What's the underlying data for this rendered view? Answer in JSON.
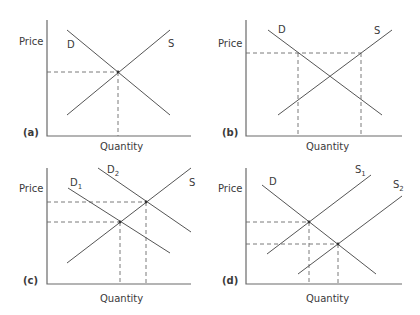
{
  "figure": {
    "axis_labels": {
      "y": "Price",
      "x": "Quantity"
    },
    "panels": [
      {
        "id": "a",
        "label": "(a)",
        "axes": {
          "x0": 47,
          "y_top": 20,
          "y0": 136,
          "x_end": 191
        },
        "ylabel_pos": [
          19,
          45
        ],
        "xlabel_pos": [
          100,
          150
        ],
        "panel_label_pos": [
          23,
          136
        ],
        "curves": [
          {
            "name": "D",
            "sub": "",
            "x1": 67,
            "y1": 30,
            "x2": 170,
            "y2": 115,
            "label_pos": [
              67,
              48
            ]
          },
          {
            "name": "S",
            "sub": "",
            "x1": 67,
            "y1": 115,
            "x2": 170,
            "y2": 30,
            "label_pos": [
              168,
              47
            ]
          }
        ],
        "dashes": [
          {
            "x1": 47,
            "y1": 72,
            "x2": 118,
            "y2": 72
          },
          {
            "x1": 118,
            "y1": 72,
            "x2": 118,
            "y2": 136
          }
        ],
        "points": [
          [
            118,
            72
          ]
        ]
      },
      {
        "id": "b",
        "label": "(b)",
        "axes": {
          "x0": 246,
          "y_top": 20,
          "y0": 136,
          "x_end": 402
        },
        "ylabel_pos": [
          218,
          47
        ],
        "xlabel_pos": [
          306,
          150
        ],
        "panel_label_pos": [
          222,
          136
        ],
        "curves": [
          {
            "name": "D",
            "sub": "",
            "x1": 268,
            "y1": 30,
            "x2": 382,
            "y2": 115,
            "label_pos": [
              278,
              33
            ]
          },
          {
            "name": "S",
            "sub": "",
            "x1": 278,
            "y1": 115,
            "x2": 392,
            "y2": 30,
            "label_pos": [
              374,
              34
            ]
          }
        ],
        "dashes": [
          {
            "x1": 246,
            "y1": 53,
            "x2": 361,
            "y2": 53
          },
          {
            "x1": 298,
            "y1": 53,
            "x2": 298,
            "y2": 136
          },
          {
            "x1": 361,
            "y1": 53,
            "x2": 361,
            "y2": 136
          }
        ],
        "points": []
      },
      {
        "id": "c",
        "label": "(c)",
        "axes": {
          "x0": 47,
          "y_top": 168,
          "y0": 284,
          "x_end": 191
        },
        "ylabel_pos": [
          19,
          192
        ],
        "xlabel_pos": [
          100,
          302
        ],
        "panel_label_pos": [
          23,
          284
        ],
        "curves": [
          {
            "name": "D",
            "sub": "1",
            "x1": 68,
            "y1": 188,
            "x2": 170,
            "y2": 253,
            "label_pos": [
              70,
              186
            ]
          },
          {
            "name": "D",
            "sub": "2",
            "x1": 98,
            "y1": 168,
            "x2": 191,
            "y2": 232,
            "label_pos": [
              107,
              173
            ]
          },
          {
            "name": "S",
            "sub": "",
            "x1": 67,
            "y1": 263,
            "x2": 191,
            "y2": 168,
            "label_pos": [
              189,
              186
            ]
          }
        ],
        "dashes": [
          {
            "x1": 47,
            "y1": 202,
            "x2": 146,
            "y2": 202
          },
          {
            "x1": 47,
            "y1": 222,
            "x2": 120,
            "y2": 222
          },
          {
            "x1": 120,
            "y1": 222,
            "x2": 120,
            "y2": 284
          },
          {
            "x1": 146,
            "y1": 202,
            "x2": 146,
            "y2": 284
          }
        ],
        "points": [
          [
            120,
            222
          ],
          [
            146,
            202
          ]
        ]
      },
      {
        "id": "d",
        "label": "(d)",
        "axes": {
          "x0": 246,
          "y_top": 168,
          "y0": 284,
          "x_end": 402
        },
        "ylabel_pos": [
          218,
          192
        ],
        "xlabel_pos": [
          306,
          302
        ],
        "panel_label_pos": [
          222,
          284
        ],
        "curves": [
          {
            "name": "D",
            "sub": "",
            "x1": 262,
            "y1": 185,
            "x2": 376,
            "y2": 274,
            "label_pos": [
              269,
              185
            ]
          },
          {
            "name": "S",
            "sub": "1",
            "x1": 267,
            "y1": 254,
            "x2": 371,
            "y2": 175,
            "label_pos": [
              355,
              173
            ]
          },
          {
            "name": "S",
            "sub": "2",
            "x1": 298,
            "y1": 274,
            "x2": 402,
            "y2": 196,
            "label_pos": [
              393,
              188
            ]
          }
        ],
        "dashes": [
          {
            "x1": 246,
            "y1": 222,
            "x2": 309,
            "y2": 222
          },
          {
            "x1": 246,
            "y1": 244,
            "x2": 338,
            "y2": 244
          },
          {
            "x1": 309,
            "y1": 222,
            "x2": 309,
            "y2": 284
          },
          {
            "x1": 338,
            "y1": 244,
            "x2": 338,
            "y2": 284
          }
        ],
        "points": [
          [
            309,
            222
          ],
          [
            338,
            244
          ]
        ]
      }
    ]
  }
}
